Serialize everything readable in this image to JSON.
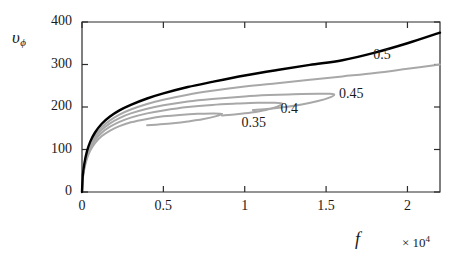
{
  "chart_data": {
    "type": "line",
    "title": "",
    "xlabel": "f",
    "ylabel": "vφ",
    "ylabel_base": "υ",
    "ylabel_sub": "ϕ",
    "x_multiplier": "× 10",
    "x_multiplier_exp": "4",
    "xlim": [
      0,
      2.2
    ],
    "ylim": [
      0,
      400
    ],
    "xticks": [
      0,
      0.5,
      1,
      1.5,
      2
    ],
    "xtick_labels": [
      "0",
      "0.5",
      "1",
      "1.5",
      "2"
    ],
    "yticks": [
      0,
      100,
      200,
      300,
      400
    ],
    "ytick_labels": [
      "0",
      "100",
      "200",
      "300",
      "400"
    ],
    "grid": false,
    "legend_position": "inline-annotations",
    "annotations": [
      {
        "label": "0.5",
        "x": 1.79,
        "y": 320,
        "color": "#1a1a1a"
      },
      {
        "label": "0.45",
        "x": 1.58,
        "y": 228,
        "color": "#1a1a1a"
      },
      {
        "label": "0.4",
        "x": 1.22,
        "y": 192,
        "color": "#1a1a1a"
      },
      {
        "label": "0.35",
        "x": 0.98,
        "y": 160,
        "color": "#1a1a1a"
      }
    ],
    "series": [
      {
        "name": "0.5",
        "color": "#000000",
        "width": 2.4,
        "description": "upper black branch, monotonically increasing",
        "points": [
          [
            0.0,
            0
          ],
          [
            0.005,
            40
          ],
          [
            0.015,
            68
          ],
          [
            0.03,
            95
          ],
          [
            0.05,
            118
          ],
          [
            0.08,
            140
          ],
          [
            0.12,
            160
          ],
          [
            0.17,
            177
          ],
          [
            0.23,
            192
          ],
          [
            0.3,
            205
          ],
          [
            0.4,
            220
          ],
          [
            0.5,
            232
          ],
          [
            0.65,
            247
          ],
          [
            0.8,
            259
          ],
          [
            1.0,
            274
          ],
          [
            1.2,
            287
          ],
          [
            1.4,
            299
          ],
          [
            1.6,
            310
          ],
          [
            1.8,
            328
          ],
          [
            2.0,
            350
          ],
          [
            2.2,
            375
          ]
        ]
      },
      {
        "name": "0.5-gray",
        "color": "#a8a8a8",
        "width": 2.0,
        "description": "gray branch labelled 0.5, rises to right edge near 300",
        "points": [
          [
            0.0,
            0
          ],
          [
            0.005,
            38
          ],
          [
            0.015,
            64
          ],
          [
            0.03,
            90
          ],
          [
            0.05,
            112
          ],
          [
            0.08,
            133
          ],
          [
            0.12,
            152
          ],
          [
            0.17,
            168
          ],
          [
            0.23,
            182
          ],
          [
            0.3,
            194
          ],
          [
            0.4,
            207
          ],
          [
            0.5,
            217
          ],
          [
            0.65,
            229
          ],
          [
            0.8,
            238
          ],
          [
            1.0,
            248
          ],
          [
            1.2,
            256
          ],
          [
            1.4,
            264
          ],
          [
            1.6,
            272
          ],
          [
            1.8,
            280
          ],
          [
            2.0,
            290
          ],
          [
            2.2,
            300
          ]
        ]
      },
      {
        "name": "0.45",
        "color": "#a8a8a8",
        "width": 2.0,
        "description": "gray fold curve turning back at about f=1.55",
        "points": [
          [
            0.0,
            0
          ],
          [
            0.005,
            36
          ],
          [
            0.015,
            62
          ],
          [
            0.03,
            87
          ],
          [
            0.05,
            108
          ],
          [
            0.08,
            128
          ],
          [
            0.12,
            146
          ],
          [
            0.17,
            161
          ],
          [
            0.23,
            174
          ],
          [
            0.3,
            185
          ],
          [
            0.4,
            196
          ],
          [
            0.5,
            204
          ],
          [
            0.65,
            213
          ],
          [
            0.8,
            219
          ],
          [
            1.0,
            225
          ],
          [
            1.15,
            228
          ],
          [
            1.3,
            230
          ],
          [
            1.45,
            231
          ],
          [
            1.52,
            231
          ],
          [
            1.55,
            229
          ],
          [
            1.52,
            222
          ],
          [
            1.45,
            214
          ],
          [
            1.35,
            206
          ],
          [
            1.25,
            200
          ],
          [
            1.15,
            196
          ],
          [
            1.05,
            193
          ]
        ]
      },
      {
        "name": "0.4",
        "color": "#a8a8a8",
        "width": 2.0,
        "description": "gray fold curve turning back at about f=1.23",
        "points": [
          [
            0.0,
            0
          ],
          [
            0.005,
            34
          ],
          [
            0.015,
            59
          ],
          [
            0.03,
            83
          ],
          [
            0.05,
            103
          ],
          [
            0.08,
            122
          ],
          [
            0.12,
            139
          ],
          [
            0.17,
            153
          ],
          [
            0.23,
            165
          ],
          [
            0.3,
            175
          ],
          [
            0.4,
            185
          ],
          [
            0.5,
            192
          ],
          [
            0.65,
            200
          ],
          [
            0.8,
            205
          ],
          [
            0.95,
            208
          ],
          [
            1.08,
            210
          ],
          [
            1.18,
            210
          ],
          [
            1.23,
            208
          ],
          [
            1.2,
            201
          ],
          [
            1.13,
            193
          ],
          [
            1.04,
            187
          ],
          [
            0.95,
            183
          ],
          [
            0.86,
            180
          ]
        ]
      },
      {
        "name": "0.35",
        "color": "#a8a8a8",
        "width": 2.0,
        "description": "gray fold curve turning back at about f=0.86",
        "points": [
          [
            0.0,
            0
          ],
          [
            0.005,
            31
          ],
          [
            0.015,
            55
          ],
          [
            0.03,
            78
          ],
          [
            0.05,
            97
          ],
          [
            0.08,
            115
          ],
          [
            0.12,
            131
          ],
          [
            0.17,
            144
          ],
          [
            0.23,
            155
          ],
          [
            0.3,
            164
          ],
          [
            0.4,
            172
          ],
          [
            0.5,
            178
          ],
          [
            0.62,
            182
          ],
          [
            0.72,
            184
          ],
          [
            0.8,
            185
          ],
          [
            0.86,
            184
          ],
          [
            0.82,
            178
          ],
          [
            0.74,
            171
          ],
          [
            0.65,
            166
          ],
          [
            0.56,
            162
          ],
          [
            0.47,
            159
          ],
          [
            0.4,
            157
          ]
        ]
      }
    ]
  },
  "axes": {
    "x_axis_name": "f-axis",
    "y_axis_name": "v-phi-axis"
  }
}
